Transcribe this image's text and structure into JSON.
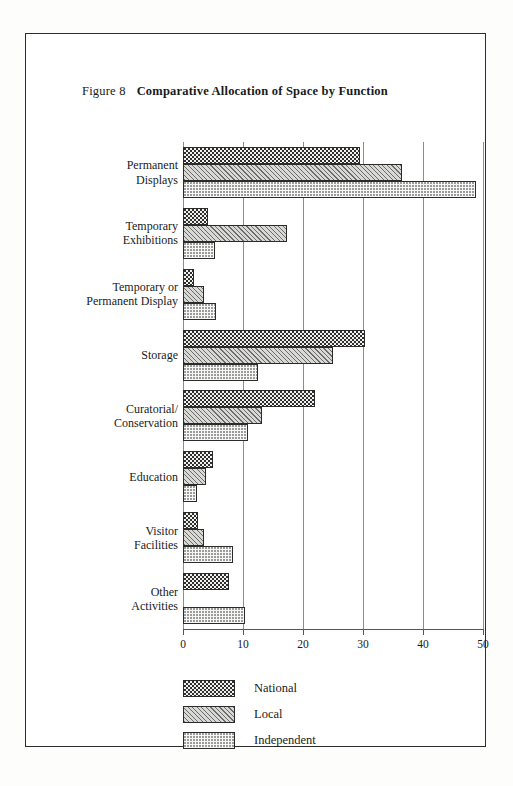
{
  "figure": {
    "number_label": "Figure 8",
    "title": "Comparative Allocation of Space by Function"
  },
  "legend": {
    "position": "bottom-left",
    "items": [
      {
        "label": "National",
        "pattern": "dense-dot"
      },
      {
        "label": "Local",
        "pattern": "diagonal-hatch"
      },
      {
        "label": "Independent",
        "pattern": "light-dot"
      }
    ]
  },
  "axis": {
    "x_ticks": [
      "0",
      "10",
      "20",
      "30",
      "40",
      "50"
    ],
    "x_min": 0,
    "x_max": 50
  },
  "chart_data": {
    "type": "bar",
    "orientation": "horizontal",
    "title": "Comparative Allocation of Space by Function",
    "xlabel": "",
    "ylabel": "",
    "xlim": [
      0,
      50
    ],
    "grid": true,
    "legend_position": "bottom-left",
    "categories": [
      "Permanent Displays",
      "Temporary Exhibitions",
      "Temporary or Permanent Display",
      "Storage",
      "Curatorial/Conservation",
      "Education",
      "Visitor Facilities",
      "Other Activities"
    ],
    "category_lines": [
      [
        "Permanent",
        "Displays"
      ],
      [
        "Temporary",
        "Exhibitions"
      ],
      [
        "Temporary or",
        "Permanent Display"
      ],
      [
        "Storage"
      ],
      [
        "Curatorial/",
        "Conservation"
      ],
      [
        "Education"
      ],
      [
        "Visitor",
        "Facilities"
      ],
      [
        "Other",
        "Activities"
      ]
    ],
    "series": [
      {
        "name": "National",
        "values": [
          29.5,
          4.2,
          1.8,
          30.3,
          22.0,
          5.0,
          2.5,
          7.7
        ]
      },
      {
        "name": "Local",
        "values": [
          36.5,
          17.3,
          3.5,
          25.0,
          13.2,
          3.8,
          3.5,
          0.0
        ]
      },
      {
        "name": "Independent",
        "values": [
          48.8,
          5.3,
          5.5,
          12.5,
          10.8,
          2.3,
          8.3,
          10.3
        ]
      }
    ]
  }
}
